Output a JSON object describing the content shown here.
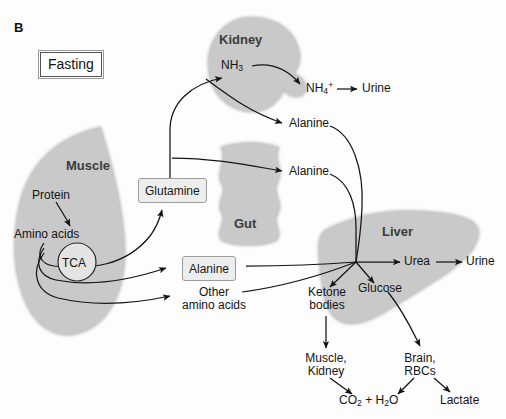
{
  "figure": {
    "panel_letter": "B",
    "state_label": "Fasting",
    "colors": {
      "organ_fill": "#c9c9c9",
      "organ_edge": "#b3b3b3",
      "organ_label": "#3b3b3b",
      "arrow": "#1a1a1a",
      "box_fill": "#eceded",
      "box_border": "#9d9d9d",
      "background": "#fdfdfd"
    }
  },
  "organs": [
    {
      "id": "kidney",
      "label": "Kidney"
    },
    {
      "id": "muscle",
      "label": "Muscle"
    },
    {
      "id": "gut",
      "label": "Gut"
    },
    {
      "id": "liver",
      "label": "Liver"
    }
  ],
  "nodes": {
    "nh3": "NH",
    "nh3_sub": "3",
    "nh4": "NH",
    "nh4_sub": "4",
    "nh4_sup": "+",
    "urine_kidney": "Urine",
    "alanine_kidney": "Alanine",
    "alanine_gut": "Alanine",
    "protein": "Protein",
    "amino_acids": "Amino acids",
    "tca": "TCA",
    "glutamine": "Glutamine",
    "alanine_muscle": "Alanine",
    "other_amino_acids_line1": "Other",
    "other_amino_acids_line2": "amino acids",
    "urea": "Urea",
    "urine_liver": "Urine",
    "glucose": "Glucose",
    "ketone_line1": "Ketone",
    "ketone_line2": "bodies",
    "muscle_kidney_line1": "Muscle,",
    "muscle_kidney_line2": "Kidney",
    "brain_rbc_line1": "Brain,",
    "brain_rbc_line2": "RBCs",
    "co2_h2o_a": "CO",
    "co2_h2o_a_sub": "2",
    "co2_h2o_mid": " + H",
    "co2_h2o_b_sub": "2",
    "co2_h2o_end": "O",
    "lactate": "Lactate"
  },
  "flows": [
    {
      "from": "glutamine",
      "to": "nh3",
      "organ": "kidney"
    },
    {
      "from": "nh3",
      "to": "nh4",
      "organ": "kidney"
    },
    {
      "from": "nh4",
      "to": "urine_kidney",
      "organ": "kidney"
    },
    {
      "from": "kidney",
      "to": "alanine_kidney",
      "organ": "kidney"
    },
    {
      "from": "gut",
      "to": "alanine_gut",
      "organ": "gut"
    },
    {
      "from": "protein",
      "to": "amino_acids",
      "organ": "muscle"
    },
    {
      "from": "amino_acids",
      "to": "glutamine",
      "organ": "muscle"
    },
    {
      "from": "amino_acids",
      "to": "alanine_muscle",
      "organ": "muscle"
    },
    {
      "from": "amino_acids",
      "to": "other_amino_acids",
      "organ": "muscle"
    },
    {
      "from": "alanine_kidney",
      "to": "liver_hub",
      "organ": "liver"
    },
    {
      "from": "alanine_gut",
      "to": "liver_hub",
      "organ": "liver"
    },
    {
      "from": "alanine_muscle",
      "to": "liver_hub",
      "organ": "liver"
    },
    {
      "from": "other_amino_acids",
      "to": "liver_hub",
      "organ": "liver"
    },
    {
      "from": "liver_hub",
      "to": "urea",
      "organ": "liver"
    },
    {
      "from": "urea",
      "to": "urine_liver",
      "organ": "liver"
    },
    {
      "from": "liver_hub",
      "to": "glucose",
      "organ": "liver"
    },
    {
      "from": "liver_hub",
      "to": "ketone_bodies",
      "organ": "liver"
    },
    {
      "from": "ketone_bodies",
      "to": "muscle_kidney",
      "organ": "liver"
    },
    {
      "from": "glucose",
      "to": "brain_rbcs",
      "organ": "liver"
    },
    {
      "from": "muscle_kidney",
      "to": "co2_h2o",
      "organ": "liver"
    },
    {
      "from": "brain_rbcs",
      "to": "co2_h2o",
      "organ": "liver"
    },
    {
      "from": "brain_rbcs",
      "to": "lactate",
      "organ": "liver"
    }
  ]
}
